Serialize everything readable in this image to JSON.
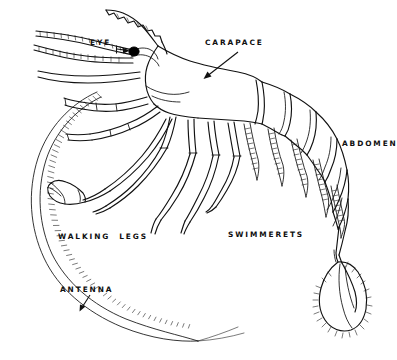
{
  "figure": {
    "background_color": "#ffffff",
    "ink_color": "#111111",
    "width": 397,
    "height": 360
  },
  "labels": {
    "eye": "EYE",
    "carapace": "CARAPACE",
    "abdomen": "ABDOMEN",
    "walking_legs": "WALKING  LEGS",
    "swimmerets": "SWIMMERETS",
    "antenna": "ANTENNA"
  },
  "label_positions": {
    "eye": {
      "x": 90,
      "y": 45
    },
    "carapace": {
      "x": 205,
      "y": 45
    },
    "abdomen": {
      "x": 342,
      "y": 146
    },
    "walking_legs": {
      "x": 58,
      "y": 239
    },
    "swimmerets": {
      "x": 228,
      "y": 237
    },
    "antenna": {
      "x": 60,
      "y": 292
    }
  },
  "leaders": [
    {
      "name": "eye-leader",
      "from": {
        "x": 117,
        "y": 48
      },
      "to": {
        "x": 131,
        "y": 51
      }
    },
    {
      "name": "carapace-leader",
      "from": {
        "x": 236,
        "y": 52
      },
      "to": {
        "x": 203,
        "y": 79
      }
    },
    {
      "name": "antenna-leader",
      "from": {
        "x": 88,
        "y": 296
      },
      "to": {
        "x": 80,
        "y": 311
      }
    }
  ],
  "parts": [
    "rostrum",
    "eye",
    "antennules",
    "antenna",
    "carapace",
    "walking-legs",
    "cheliped",
    "abdomen-segments",
    "swimmerets",
    "tail-fan"
  ]
}
